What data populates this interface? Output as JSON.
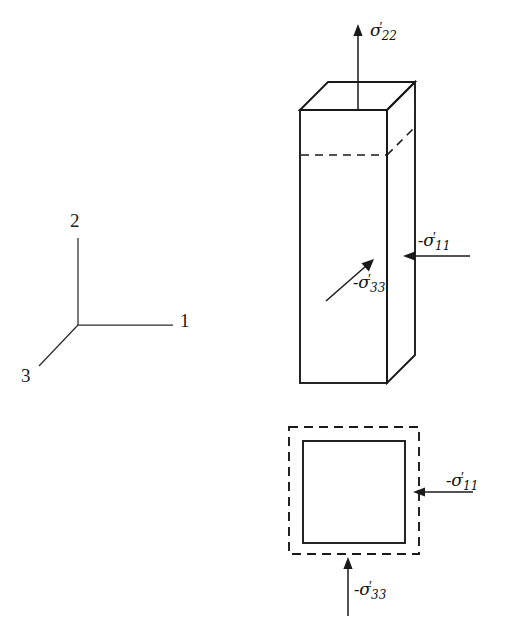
{
  "figure": {
    "background_color": "#ffffff",
    "line_color": "#1a1a1a"
  },
  "axes": {
    "name": "coordinate-triad",
    "origin": {
      "x": 78,
      "y": 325
    },
    "items": [
      {
        "id": "axis-1",
        "label": "1",
        "direction": "right",
        "end_x": 173,
        "end_y": 325,
        "label_x": 180,
        "label_y": 315
      },
      {
        "id": "axis-2",
        "label": "2",
        "direction": "up",
        "end_x": 78,
        "end_y": 238,
        "label_x": 71,
        "label_y": 222
      },
      {
        "id": "axis-3",
        "label": "3",
        "direction": "down-left",
        "end_x": 39,
        "end_y": 366,
        "label_x": 22,
        "label_y": 368
      }
    ]
  },
  "prism": {
    "name": "three-dimensional-prism",
    "front_face": {
      "left": 300,
      "right": 387,
      "top": 110,
      "bottom": 383
    },
    "depth_offset": {
      "dx": 28,
      "dy": -28
    },
    "hidden_edge_y": 155,
    "labels": {
      "sigma22": {
        "neg": "",
        "symbol": "σ",
        "prime": "′",
        "subscript": "22"
      },
      "sigma11": {
        "neg": "-",
        "symbol": "σ",
        "prime": "′",
        "subscript": "11"
      },
      "sigma33": {
        "neg": "-",
        "symbol": "σ",
        "prime": "′",
        "subscript": "33"
      }
    },
    "arrows": [
      {
        "id": "arrow-sigma22",
        "label_id": "sigma22",
        "from": "inside-top",
        "direction": "up",
        "x": 358,
        "tail_y": 110,
        "head_y": 26,
        "label_x": 370,
        "label_y": 22
      },
      {
        "id": "arrow-sigma11",
        "label_id": "sigma11",
        "from": "right",
        "direction": "left",
        "y": 256,
        "tail_x": 470,
        "head_x": 404,
        "label_x": 418,
        "label_y": 233
      },
      {
        "id": "arrow-sigma33",
        "label_id": "sigma33",
        "from": "lower-left",
        "direction": "up-right",
        "tail_x": 326,
        "tail_y": 300,
        "head_x": 370,
        "head_y": 262,
        "label_x": 354,
        "label_y": 275
      }
    ]
  },
  "cross_section": {
    "name": "cross-section-plan-view",
    "solid_square": {
      "left": 303,
      "top": 441,
      "right": 405,
      "bottom": 543
    },
    "dashed_square": {
      "left": 289,
      "top": 427,
      "right": 419,
      "bottom": 554
    },
    "labels": {
      "sigma11": {
        "neg": "-",
        "symbol": "σ",
        "prime": "′",
        "subscript": "11"
      },
      "sigma33": {
        "neg": "-",
        "symbol": "σ",
        "prime": "′",
        "subscript": "33"
      }
    },
    "arrows": [
      {
        "id": "arrow-cs-sigma11",
        "label_id": "sigma11",
        "direction": "left",
        "y": 492,
        "tail_x": 473,
        "head_x": 414,
        "label_x": 447,
        "label_y": 473
      },
      {
        "id": "arrow-cs-sigma33",
        "label_id": "sigma33",
        "direction": "up",
        "x": 348,
        "tail_y": 615,
        "head_y": 559,
        "label_x": 355,
        "label_y": 582
      }
    ]
  }
}
